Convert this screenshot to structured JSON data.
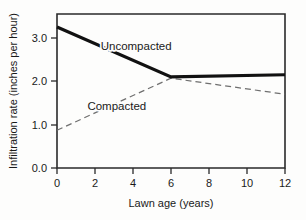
{
  "chart_data": {
    "type": "line",
    "title": "",
    "xlabel": "Lawn age (years)",
    "ylabel": "Infiltration rate (inches per hour)",
    "xlim": [
      0,
      12
    ],
    "ylim": [
      0.0,
      3.55
    ],
    "xticks": [
      0,
      2,
      4,
      6,
      8,
      10,
      12
    ],
    "xticklabels": [
      "0",
      "2",
      "4",
      "6",
      "8",
      "10",
      "12"
    ],
    "yticks": [
      0.0,
      1.0,
      2.0,
      3.0
    ],
    "yticklabels": [
      "0.0",
      "1.0",
      "2.0",
      "3.0"
    ],
    "grid": false,
    "legend": "inline-annotations",
    "series": [
      {
        "name": "Uncompacted",
        "style": "solid",
        "color": "#111111",
        "x": [
          0,
          6,
          12
        ],
        "values": [
          3.25,
          2.1,
          2.15
        ]
      },
      {
        "name": "Compacted",
        "style": "dashed",
        "color": "#6f6f6f",
        "x": [
          0,
          6,
          12
        ],
        "values": [
          0.87,
          2.07,
          1.7
        ]
      }
    ],
    "annotations": [
      {
        "text": "Uncompacted",
        "x": 2.3,
        "y": 2.72
      },
      {
        "text": "Compacted",
        "x": 1.6,
        "y": 1.33
      }
    ]
  }
}
